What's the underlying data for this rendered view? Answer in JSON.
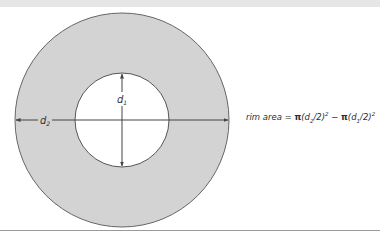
{
  "diagram": {
    "labels": {
      "outer_diameter": "d",
      "outer_diameter_sub": "2",
      "inner_diameter": "d",
      "inner_diameter_sub": "1"
    },
    "formula": {
      "prefix": "rim area = ",
      "pi": "π",
      "term1_open": "(d",
      "term1_sub": "2",
      "term1_close": "/2)",
      "term1_sup": "2",
      "minus": " − ",
      "term2_open": "(d",
      "term2_sub": "1",
      "term2_close": "/2)",
      "term2_sup": "2"
    },
    "colors": {
      "rim_fill": "#d3d3d3",
      "inner_fill": "#ffffff",
      "stroke": "#555555",
      "header": "#e6e6e6"
    }
  }
}
